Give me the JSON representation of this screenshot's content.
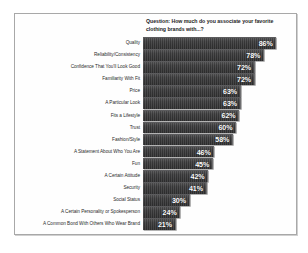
{
  "chart_data": {
    "type": "bar",
    "orientation": "horizontal",
    "title": "Question: How much do you associate your favorite clothing brands with...?",
    "xlabel": "",
    "ylabel": "",
    "xlim": [
      0,
      100
    ],
    "grid": false,
    "legend": "none",
    "value_suffix": "%",
    "categories": [
      "Quality",
      "Reliability/Consistency",
      "Confidence That You'll Look Good",
      "Familiarity With Fit",
      "Price",
      "A Particular Look",
      "Fits a Lifestyle",
      "Trust",
      "Fashion/Style",
      "A Statement About Who You Are",
      "Fun",
      "A Certain Attitude",
      "Security",
      "Social Status",
      "A Certain Personality or Spokesperson",
      "A Common Bond With Others Who Wear Brand"
    ],
    "values": [
      86,
      78,
      72,
      72,
      63,
      63,
      62,
      60,
      58,
      46,
      45,
      42,
      41,
      30,
      24,
      21
    ],
    "value_labels": [
      "86%",
      "78%",
      "72%",
      "72%",
      "63%",
      "63%",
      "62%",
      "60%",
      "58%",
      "46%",
      "45%",
      "42%",
      "41%",
      "30%",
      "24%",
      "21%"
    ],
    "bar_color": "#39393a",
    "value_label_color": "#ffffff",
    "background_color": "#fefefe",
    "frame_color": "#a8a8a8"
  }
}
